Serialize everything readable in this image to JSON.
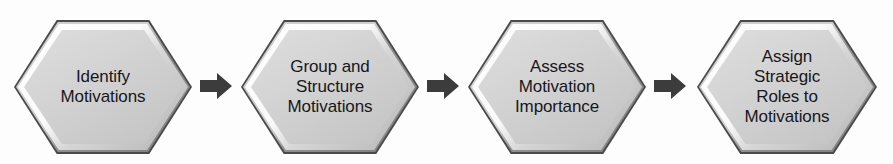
{
  "diagram": {
    "type": "linear-process-flow",
    "background_color": "#fdfdfd",
    "node_shape": "hexagon",
    "node_fill_color": "#d2d2d3",
    "node_border_color": "#4a4a4a",
    "node_highlight_color": "#fbfbfb",
    "node_shadow_color": "#858585",
    "text_color": "#17171a",
    "connector_color": "#3c3c3c",
    "connector_shape": "block-arrow-right",
    "steps": [
      {
        "index": 1,
        "label": "Identify\nMotivations",
        "x": 14,
        "width": 178
      },
      {
        "index": 2,
        "label": "Group and\nStructure\nMotivations",
        "x": 241,
        "width": 178
      },
      {
        "index": 3,
        "label": "Assess\nMotivation\nImportance",
        "x": 468,
        "width": 178
      },
      {
        "index": 4,
        "label": "Assign\nStrategic\nRoles to\nMotivations",
        "x": 697,
        "width": 180
      }
    ],
    "connectors": [
      {
        "index": 1,
        "from_step": 1,
        "to_step": 2,
        "x": 200,
        "name": "arrow-1-to-2"
      },
      {
        "index": 2,
        "from_step": 2,
        "to_step": 3,
        "x": 427,
        "name": "arrow-2-to-3"
      },
      {
        "index": 3,
        "from_step": 3,
        "to_step": 4,
        "x": 654,
        "name": "arrow-3-to-4"
      }
    ]
  }
}
